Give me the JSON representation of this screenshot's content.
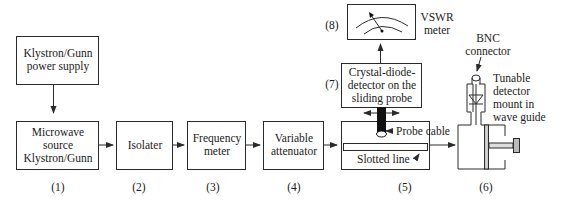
{
  "diagram": {
    "blocks": [
      {
        "id": "power-supply",
        "lines": [
          "Klystron/Gunn",
          "power supply"
        ]
      },
      {
        "id": "source",
        "lines": [
          "Microwave",
          "source",
          "Klystron/Gunn"
        ],
        "number": "(1)"
      },
      {
        "id": "isolater",
        "lines": [
          "Isolater"
        ],
        "number": "(2)"
      },
      {
        "id": "frequency-meter",
        "lines": [
          "Frequency",
          "meter"
        ],
        "number": "(3)"
      },
      {
        "id": "variable-attenuator",
        "lines": [
          "Variable",
          "attenuator"
        ],
        "number": "(4)"
      },
      {
        "id": "slotted-line-section",
        "number": "(5)"
      },
      {
        "id": "detector-mount",
        "number": "(6)"
      },
      {
        "id": "crystal-detector",
        "lines": [
          "Crystal-diode-",
          "detector on the",
          "sliding probe"
        ],
        "number": "(7)"
      },
      {
        "id": "vswr-meter",
        "number": "(8)"
      }
    ],
    "annotations": {
      "vswr_meter": [
        "VSWR",
        "meter"
      ],
      "probe_cable": "Probe cable",
      "slotted_line": "Slotted line",
      "bnc_connector": [
        "BNC",
        "connector"
      ],
      "tunable_mount": [
        "Tunable",
        "detector",
        "mount in",
        "wave guide"
      ]
    },
    "colors": {
      "line": "#2a2a2a",
      "background": "#ffffff"
    }
  }
}
